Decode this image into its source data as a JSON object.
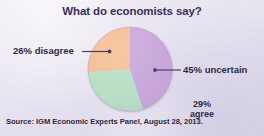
{
  "figure": {
    "title": "What do economists say?",
    "source_note": "Source: IGM Economic Experts Panel, August 28, 2013.",
    "background_color": "#e9e5f1",
    "title_color": "#3b2f5e",
    "text_color": "#2f2a46",
    "leader_line_color": "#4b3f6b"
  },
  "labels": {
    "uncertain": "45% uncertain",
    "disagree": "26% disagree",
    "agree_percent": "29%",
    "agree_word": "agree"
  },
  "chart_data": {
    "type": "pie",
    "title": "What do economists say?",
    "subtitle": "",
    "xlabel": "",
    "ylabel": "",
    "grid": false,
    "legend_position": "callout-labels",
    "start_angle_deg": 0,
    "direction": "clockwise",
    "categories": [
      "uncertain",
      "agree",
      "disagree"
    ],
    "values": [
      45,
      29,
      26
    ],
    "value_unit": "percent",
    "labels": [
      "45% uncertain",
      "29% agree",
      "26% disagree"
    ],
    "colors": [
      "#c6a3d9",
      "#b4dcc2",
      "#f5ba8d"
    ],
    "slices": [
      {
        "name": "uncertain",
        "label": "45% uncertain",
        "value": 45,
        "color": "#c6a3d9",
        "start_deg": 0,
        "sweep_deg": 162,
        "label_placement": "outside-right"
      },
      {
        "name": "agree",
        "label": "29% agree",
        "value": 29,
        "color": "#b4dcc2",
        "start_deg": 162,
        "sweep_deg": 104.4,
        "label_placement": "inside"
      },
      {
        "name": "disagree",
        "label": "26% disagree",
        "value": 26,
        "color": "#f5ba8d",
        "start_deg": 266.4,
        "sweep_deg": 93.6,
        "label_placement": "outside-left"
      }
    ],
    "source": "Source: IGM Economic Experts Panel, August 28, 2013."
  }
}
